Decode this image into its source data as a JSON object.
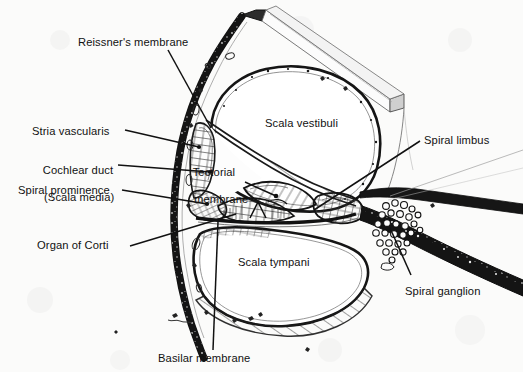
{
  "figure": {
    "kind": "anatomical-line-drawing",
    "background_color": "#fbfbfa",
    "ink_color": "#111111"
  },
  "labels": {
    "reissners_membrane": "Reissner's membrane",
    "stria_vascularis": "Stria vascularis",
    "cochlear_duct_line1": "Cochlear duct",
    "cochlear_duct_line2": "(Scala media)",
    "spiral_prominence": "Spiral prominence",
    "organ_of_corti": "Organ of Corti",
    "tectorial_line1": "Tectorial",
    "tectorial_line2": "membrane",
    "scala_vestibuli": "Scala vestibuli",
    "scala_tympani": "Scala tympani",
    "spiral_limbus": "Spiral limbus",
    "spiral_ganglion": "Spiral ganglion",
    "basilar_membrane": "Basilar membrane"
  },
  "structures": [
    {
      "name": "scala-vestibuli",
      "type": "chamber",
      "label_ref": "scala_vestibuli"
    },
    {
      "name": "scala-tympani",
      "type": "chamber",
      "label_ref": "scala_tympani"
    },
    {
      "name": "cochlear-duct",
      "type": "chamber",
      "label_ref": "cochlear_duct_line1"
    },
    {
      "name": "reissners-membrane",
      "type": "membrane",
      "label_ref": "reissners_membrane"
    },
    {
      "name": "basilar-membrane",
      "type": "membrane",
      "label_ref": "basilar_membrane"
    },
    {
      "name": "tectorial-membrane",
      "type": "membrane",
      "label_ref": "tectorial_line1"
    },
    {
      "name": "stria-vascularis",
      "type": "tissue",
      "label_ref": "stria_vascularis"
    },
    {
      "name": "spiral-prominence",
      "type": "tissue",
      "label_ref": "spiral_prominence"
    },
    {
      "name": "organ-of-corti",
      "type": "organ",
      "label_ref": "organ_of_corti"
    },
    {
      "name": "spiral-limbus",
      "type": "tissue",
      "label_ref": "spiral_limbus"
    },
    {
      "name": "spiral-ganglion",
      "type": "neural-cluster",
      "label_ref": "spiral_ganglion"
    }
  ]
}
